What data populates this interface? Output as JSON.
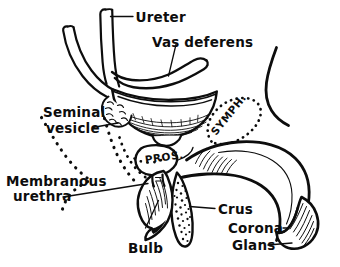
{
  "figure": {
    "kind": "anatomical-line-drawing",
    "background_color": "#ffffff",
    "ink_color": "#0d0d0d",
    "width": 340,
    "height": 267
  },
  "labels": {
    "ureter": "Ureter",
    "vas_deferens": "Vas deferens",
    "seminal_vesicle_line1": "Seminal",
    "seminal_vesicle_line2": "vesicle",
    "membranous_urethra_line1": "Membranous",
    "membranous_urethra_line2": "urethra",
    "prostate": "PROS.",
    "symphysis": "SYMPH.",
    "crus": "Crus",
    "bulb": "Bulb",
    "corona": "Corona",
    "glans": "Glans"
  },
  "structures": [
    {
      "name": "ureter",
      "label": "Ureter",
      "rendering": "open-ended tube, upper left"
    },
    {
      "name": "vas-deferens",
      "label": "Vas deferens",
      "rendering": "hooked duct over bladder"
    },
    {
      "name": "urinary-bladder",
      "label": "",
      "rendering": "bowl shape with hatched wall"
    },
    {
      "name": "seminal-vesicle",
      "label": "Seminal vesicle",
      "rendering": "lobulated sac left of bladder neck"
    },
    {
      "name": "prostate",
      "label": "PROS.",
      "rendering": "rounded gland below bladder"
    },
    {
      "name": "pubic-symphysis",
      "label": "SYMPH.",
      "rendering": "dotted oval"
    },
    {
      "name": "membranous-urethra",
      "label": "Membranous urethra",
      "rendering": "short channel below prostate"
    },
    {
      "name": "bulb",
      "label": "Bulb",
      "rendering": "hatched lobe at penile root"
    },
    {
      "name": "crus",
      "label": "Crus",
      "rendering": "stippled elongated body"
    },
    {
      "name": "penile-shaft",
      "label": "",
      "rendering": "long curved shaft to lower right"
    },
    {
      "name": "corona",
      "label": "Corona",
      "rendering": "ridge at glans base"
    },
    {
      "name": "glans",
      "label": "Glans",
      "rendering": "hatched terminal cap"
    },
    {
      "name": "rectum-outline",
      "label": "",
      "rendering": "dashed S-curve at left"
    }
  ]
}
